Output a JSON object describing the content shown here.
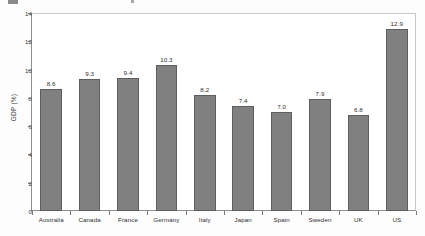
{
  "chart_data": {
    "type": "bar",
    "title": "",
    "subtitle": "",
    "xlabel": "",
    "ylabel": "GDP (%)",
    "categories": [
      "Australia",
      "Canada",
      "France",
      "Germany",
      "Italy",
      "Japan",
      "Spain",
      "Sweden",
      "UK",
      "US"
    ],
    "values": [
      8.6,
      9.3,
      9.4,
      10.3,
      8.2,
      7.4,
      7.0,
      7.9,
      6.8,
      12.9
    ],
    "value_labels": [
      "8.6",
      "9.3",
      "9.4",
      "10.3",
      "8.2",
      "7.4",
      "7.0",
      "7.9",
      "6.8",
      "12.9"
    ],
    "ylim": [
      0,
      14
    ],
    "y_ticks": [
      0,
      2,
      4,
      6,
      8,
      10,
      12,
      14
    ],
    "y_tick_labels": [
      "0",
      "2",
      "4",
      "6",
      "8",
      "10",
      "12",
      "14"
    ],
    "grid": false,
    "legend": null,
    "bar_color": "#808080",
    "bar_edge_color": "#5e5e5e",
    "axis_color": "#8f8f8f",
    "text_color": "#2e2e2e",
    "background_color": "#ffffff"
  }
}
